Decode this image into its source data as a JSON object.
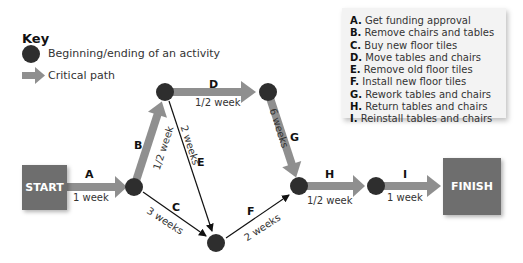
{
  "key": {
    "title": "Key",
    "node_label": "Beginning/ending of an activity",
    "critical_label": "Critical path"
  },
  "legend": {
    "items": [
      {
        "letter": "A.",
        "text": "Get funding approval"
      },
      {
        "letter": "B.",
        "text": "Remove chairs and tables"
      },
      {
        "letter": "C.",
        "text": "Buy new floor tiles"
      },
      {
        "letter": "D.",
        "text": "Move tables and chairs"
      },
      {
        "letter": "E.",
        "text": "Remove old floor tiles"
      },
      {
        "letter": "F.",
        "text": "Install new floor tiles"
      },
      {
        "letter": "G.",
        "text": "Rework tables and chairs"
      },
      {
        "letter": "H.",
        "text": "Return tables and chairs"
      },
      {
        "letter": "I.",
        "text": "Reinstall tables and chairs"
      }
    ]
  },
  "terminals": {
    "start": "START",
    "finish": "FINISH"
  },
  "activities": {
    "A": {
      "label": "A",
      "duration": "1 week",
      "critical": true
    },
    "B": {
      "label": "B",
      "duration": "1/2 week",
      "critical": true
    },
    "C": {
      "label": "C",
      "duration": "3 weeks",
      "critical": false
    },
    "D": {
      "label": "D",
      "duration": "1/2 week",
      "critical": true
    },
    "E": {
      "label": "E",
      "duration": "2 weeks",
      "critical": false
    },
    "F": {
      "label": "F",
      "duration": "2 weeks",
      "critical": false
    },
    "G": {
      "label": "G",
      "duration": "6 weeks",
      "critical": true
    },
    "H": {
      "label": "H",
      "duration": "1/2 week",
      "critical": true
    },
    "I": {
      "label": "I",
      "duration": "1 week",
      "critical": true
    }
  },
  "colors": {
    "node": "#2e2e2e",
    "critical_arrow": "#8f8f8f",
    "terminal": "#6e6e6e",
    "legend_bg": "#f3f3f3"
  }
}
